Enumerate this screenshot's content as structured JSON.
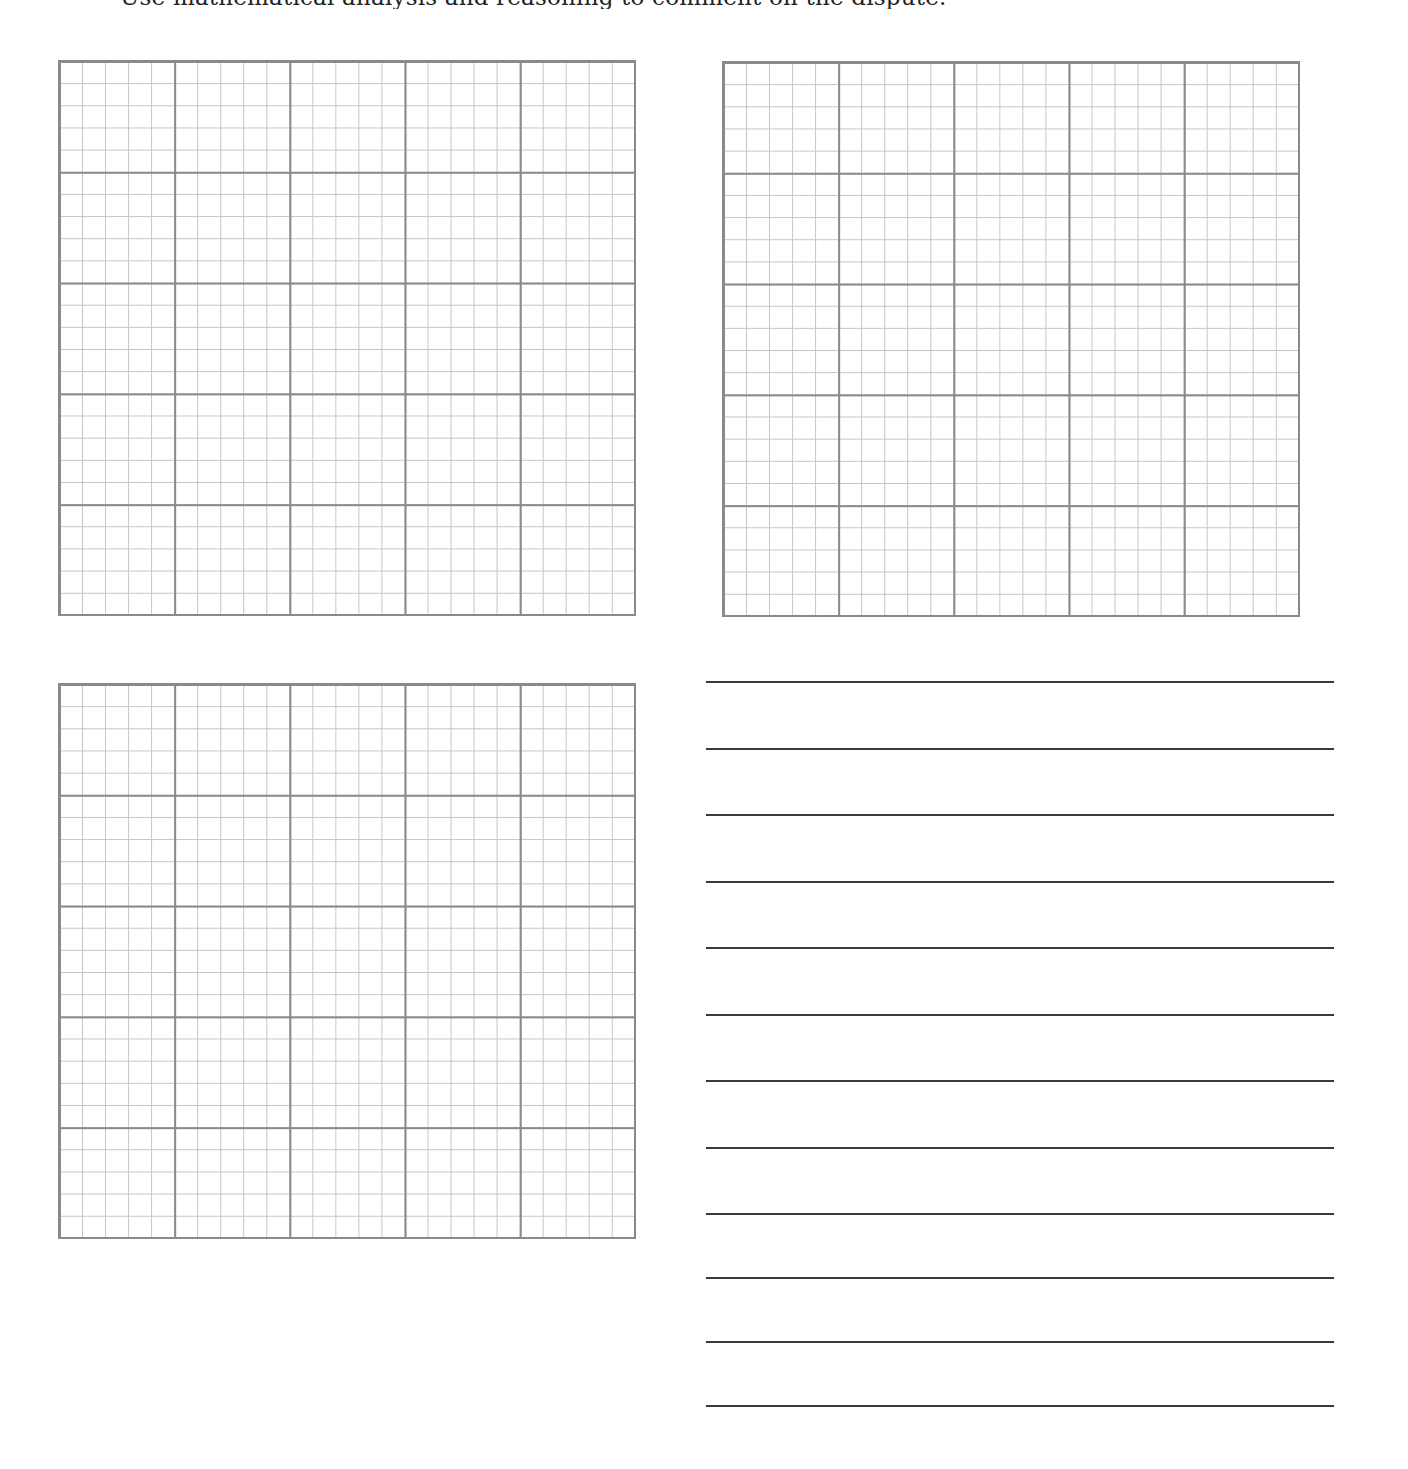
{
  "header": {
    "instruction_text_clipped": "Use mathematical analysis and reasoning to comment on the dispute."
  },
  "worksheet": {
    "grids": [
      {
        "id": "grid-1",
        "major_columns": 5,
        "major_rows": 5,
        "minor_per_major": 5
      },
      {
        "id": "grid-2",
        "major_columns": 5,
        "major_rows": 5,
        "minor_per_major": 5
      },
      {
        "id": "grid-3",
        "major_columns": 5,
        "major_rows": 5,
        "minor_per_major": 5
      }
    ],
    "writing_lines": {
      "count": 12,
      "y_positions": [
        682,
        749,
        815,
        882,
        948,
        1015,
        1081,
        1148,
        1214,
        1278,
        1342,
        1406
      ]
    }
  },
  "colors": {
    "major_grid_line": "#8a8a8a",
    "minor_grid_line": "#c4c4c4",
    "writing_line": "#3a3a3a",
    "background": "#ffffff"
  }
}
